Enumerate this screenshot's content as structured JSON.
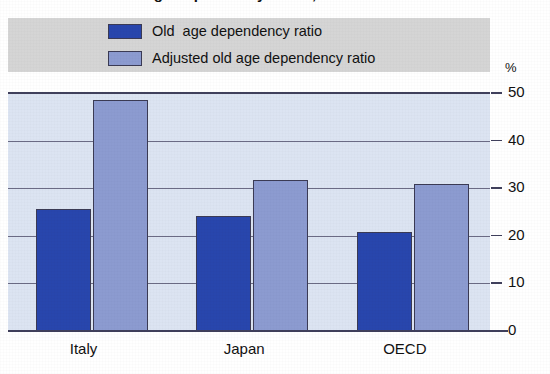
{
  "chart_data": {
    "type": "bar",
    "title": "Old age dependency ratios, 2000",
    "title_note": "clipped at top edge of screenshot",
    "categories": [
      "Italy",
      "Japan",
      "OECD"
    ],
    "series": [
      {
        "name": "Old  age dependency ratio",
        "color": "#2846ad",
        "values": [
          25.8,
          24.4,
          21.0
        ]
      },
      {
        "name": "Adjusted old age dependency ratio",
        "color": "#8c9bd0",
        "values": [
          48.8,
          32.0,
          31.0
        ]
      }
    ],
    "xlabel": "",
    "ylabel": "%",
    "ylim": [
      0,
      50
    ],
    "yticks": [
      0,
      10,
      20,
      30,
      40,
      50
    ],
    "ytick_labels": [
      "0",
      "10",
      "20",
      "30",
      "40",
      "50"
    ],
    "axis_position": "right",
    "grid": true,
    "legend_position": "top",
    "plot_background": "#dce4f2",
    "legend_background": "#d5d5d5"
  },
  "legend": {
    "items": [
      {
        "label": "Old  age dependency ratio"
      },
      {
        "label": "Adjusted old age dependency ratio"
      }
    ]
  },
  "axis": {
    "unit_label": "%",
    "ticks": [
      "50",
      "40",
      "30",
      "20",
      "10",
      "0"
    ]
  },
  "categories": [
    {
      "label": "Italy"
    },
    {
      "label": "Japan"
    },
    {
      "label": "OECD"
    }
  ]
}
